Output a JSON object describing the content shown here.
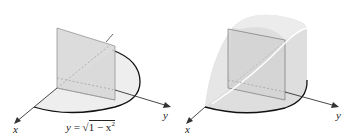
{
  "figure": {
    "left_panel": {
      "description": "Quarter-disk base with vertical square cross-section",
      "axis_labels": {
        "x": "x",
        "y": "y"
      },
      "equation": {
        "lhs": "y",
        "equals": "=",
        "radicand": "1 − x",
        "exponent": "2"
      }
    },
    "right_panel": {
      "description": "Solid with square cross-sections over quarter-disk base",
      "axis_labels": {
        "x": "x",
        "y": "y"
      }
    },
    "colors": {
      "axis": "#333333",
      "base_fill": "#eeeeee",
      "base_edge": "#111111",
      "plane_fill": "#d4d4d4",
      "solid_fill": "#dedede",
      "highlight_curve": "#ffffff"
    }
  }
}
